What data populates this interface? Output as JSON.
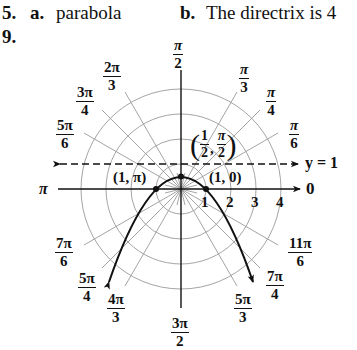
{
  "header": {
    "item5_number": "5.",
    "item5a_label": "a.",
    "item5a_text": "parabola",
    "item5b_label": "b.",
    "item5b_text": "The directrix is 4",
    "item9_number": "9."
  },
  "graph": {
    "angle_labels": [
      {
        "id": "pi-over-2",
        "num": "π",
        "den": "2"
      },
      {
        "id": "pi-over-3",
        "num": "π",
        "den": "3"
      },
      {
        "id": "pi-over-4",
        "num": "π",
        "den": "4"
      },
      {
        "id": "pi-over-6",
        "num": "π",
        "den": "6"
      },
      {
        "id": "2pi-over-3",
        "num": "2π",
        "den": "3"
      },
      {
        "id": "3pi-over-4",
        "num": "3π",
        "den": "4"
      },
      {
        "id": "5pi-over-6",
        "num": "5π",
        "den": "6"
      },
      {
        "id": "7pi-over-6",
        "num": "7π",
        "den": "6"
      },
      {
        "id": "5pi-over-4",
        "num": "5π",
        "den": "4"
      },
      {
        "id": "4pi-over-3",
        "num": "4π",
        "den": "3"
      },
      {
        "id": "3pi-over-2",
        "num": "3π",
        "den": "2"
      },
      {
        "id": "5pi-over-3",
        "num": "5π",
        "den": "3"
      },
      {
        "id": "7pi-over-4",
        "num": "7π",
        "den": "4"
      },
      {
        "id": "11pi-over-6",
        "num": "11π",
        "den": "6"
      }
    ],
    "axis_labels": {
      "pi": "π",
      "zero": "0"
    },
    "radius_ticks": [
      "1",
      "2",
      "3",
      "4"
    ],
    "directrix_label": "y = 1",
    "points": {
      "vertex": {
        "open": "(",
        "r_num": "1",
        "r_den": "2",
        "sep": ",",
        "t_num": "π",
        "t_den": "2",
        "close": ")"
      },
      "right": "(1, 0)",
      "left": "(1, π)"
    },
    "curve": "r = 1/(1 + sin θ)"
  }
}
